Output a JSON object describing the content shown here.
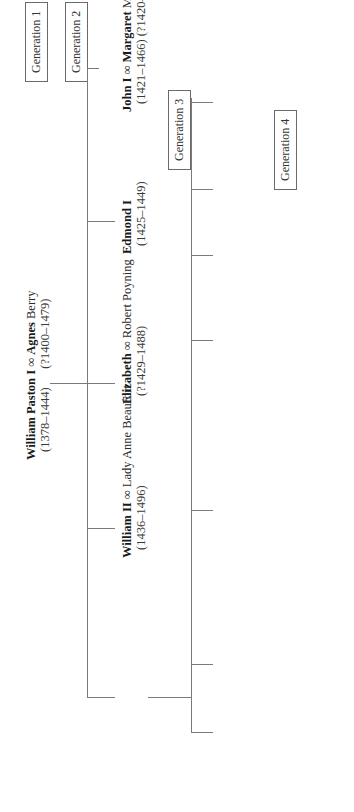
{
  "generations": [
    "Generation 1",
    "Generation 2",
    "Generation 3",
    "Generation 4"
  ],
  "gen1": {
    "head": {
      "name": "William Paston I",
      "spouse_symbol": "∞",
      "spouse_bold": "Agnes",
      "spouse_rest": " Berry",
      "dates": "(1378–1444)",
      "spouse_dates": "(?1400–1479)"
    }
  },
  "gen2": [
    {
      "name": "John I",
      "spouse_symbol": "∞",
      "spouse_bold": "Margaret",
      "spouse_rest": " Mauthy",
      "dates": "(1421–1466)",
      "spouse_dates": "(?1420–1484)"
    },
    {
      "name": "Edmond I",
      "dates": "(1425–1449)"
    },
    {
      "name": "Elizabeth",
      "spouse_symbol": "∞",
      "spouse": "Robert Poyning",
      "dates": "(?1429–1488)"
    },
    {
      "name": "William II",
      "spouse_symbol": "∞",
      "spouse": "Lady Anne Beaufort",
      "dates": "(1436–1496)"
    },
    {
      "name": "Clement II",
      "dates": "(1442–?1479)"
    }
  ],
  "gen3": [
    {
      "name": "John II",
      "dates": "(1442–1479)"
    },
    {
      "name": "John III",
      "spouse_symbol": "∞",
      "spouse_bold": "Margery",
      "spouse_rest": " Brews",
      "dates": "(1444–1504)",
      "spouse_dates": "(?1455–1495)",
      "second_spouse": "∞ Agnes Morley"
    },
    {
      "name": "Edmond II",
      "spouse_symbol": "∞",
      "spouse": "Katherine Spellman",
      "dates": "(?1443–?1504)",
      "second_spouse": "∞ Margaret Monceaux"
    },
    {
      "name_plain": "Margery",
      "line2": "∞ Richard",
      "line3": "Calle"
    },
    {
      "name_plain": "Anne",
      "line2": "∞ William",
      "line3": "Yelverton"
    },
    {
      "name": "Walter",
      "dates": "(?1456–1479)"
    },
    {
      "name": "William III",
      "dates": "(?1459–after 1504)"
    }
  ],
  "gen4": [
    {
      "name_plain": "Christopher"
    },
    {
      "name": "William IV",
      "spouse_symbol": "∞",
      "spouse": "Bridget Heydon",
      "dates": "(?1479–1554)"
    }
  ],
  "note": {
    "text": "Family members of whom letters have survived are printed in ",
    "bold": "boldface",
    "end": "."
  },
  "colors": {
    "line": "#7a7a7a",
    "text": "#2a2a2a",
    "box_border": "#6a6a6a"
  }
}
